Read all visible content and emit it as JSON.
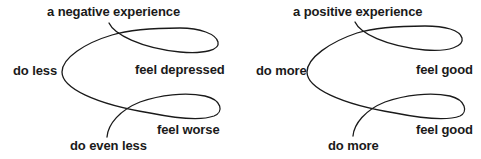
{
  "diagrams": [
    {
      "name": "negative-cycle",
      "labels": {
        "start": "a negative experience",
        "left": "do less",
        "right_top": "feel depressed",
        "right_bottom": "feel worse",
        "end": "do even less"
      }
    },
    {
      "name": "positive-cycle",
      "labels": {
        "start": "a positive experience",
        "left": "do more",
        "right_top": "feel good",
        "right_bottom": "feel good",
        "end": "do more"
      }
    }
  ],
  "style": {
    "stroke_color": "#1a1a1a",
    "text_color": "#1a1a1a",
    "background": "#ffffff"
  }
}
